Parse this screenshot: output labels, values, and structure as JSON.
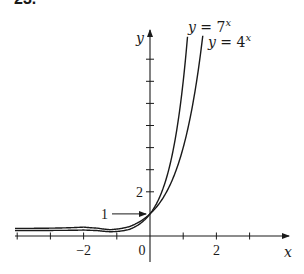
{
  "problem_number": "23.",
  "chart_data": {
    "type": "line",
    "title": "",
    "xlabel": "x",
    "ylabel": "y",
    "xlim": [
      -4.1,
      4.1
    ],
    "ylim": [
      -0.6,
      9.0
    ],
    "grid": false,
    "legend": "inline labels at curve tops",
    "x_ticks": [
      -4,
      -3,
      -2,
      -1,
      1,
      2,
      3
    ],
    "x_tick_labels": [
      {
        "value": -2,
        "label": "−2"
      },
      {
        "value": 0,
        "label": "0"
      },
      {
        "value": 2,
        "label": "2"
      }
    ],
    "y_ticks": [
      2,
      3,
      4,
      5,
      6,
      7,
      8
    ],
    "y_tick_labels": [
      {
        "value": 2,
        "label": "2"
      }
    ],
    "annotations": [
      {
        "text": "1",
        "points_to": [
          0,
          1
        ],
        "style": "arrow"
      }
    ],
    "series": [
      {
        "name": "y = 7^x",
        "label_base": "y = 7",
        "label_exp": "x",
        "base": 7,
        "x_range": [
          -4.1,
          1.13
        ]
      },
      {
        "name": "y = 4^x",
        "label_base": "y = 4",
        "label_exp": "x",
        "base": 4,
        "x_range": [
          -4.1,
          1.59
        ]
      }
    ],
    "sample_points": {
      "y = 7^x": [
        [
          -3,
          0.0029
        ],
        [
          -2,
          0.0204
        ],
        [
          -1,
          0.1429
        ],
        [
          0,
          1
        ],
        [
          0.5,
          2.6458
        ],
        [
          1,
          7
        ],
        [
          1.13,
          9.0
        ]
      ],
      "y = 4^x": [
        [
          -3,
          0.0156
        ],
        [
          -2,
          0.0625
        ],
        [
          -1,
          0.25
        ],
        [
          0,
          1
        ],
        [
          0.5,
          2
        ],
        [
          1,
          4
        ],
        [
          1.5,
          8
        ],
        [
          1.59,
          9.0
        ]
      ]
    }
  }
}
